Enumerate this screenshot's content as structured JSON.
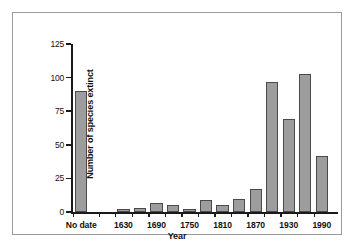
{
  "chart_data": {
    "type": "bar",
    "title": "",
    "xlabel": "Year",
    "ylabel": "Number of species extinct",
    "ylim": [
      0,
      125
    ],
    "yticks": [
      0,
      25,
      50,
      75,
      100,
      125
    ],
    "ytick_labels": [
      "0",
      "25",
      "50",
      "75",
      "100",
      "125"
    ],
    "grid": false,
    "legend": null,
    "xtick_labels": [
      "No date",
      "1630",
      "1690",
      "1750",
      "1810",
      "1870",
      "1930",
      "1990"
    ],
    "categories": [
      "No date",
      "1600",
      "1630",
      "1660",
      "1690",
      "1720",
      "1750",
      "1780",
      "1810",
      "1840",
      "1870",
      "1900",
      "1930",
      "1960",
      "1990"
    ],
    "values": [
      90,
      0,
      2,
      3,
      7,
      5,
      2,
      9,
      5,
      10,
      17,
      97,
      69,
      103,
      42
    ],
    "bar_color": "#9d9d9d",
    "bar_edge_color": "#4a4a4a",
    "axis_color": "#1a1a1a",
    "frame_color": "#9a9a9a",
    "background": "#ffffff"
  },
  "figure": {
    "frame_label": "chart-frame",
    "plot_label": "plot-area"
  }
}
